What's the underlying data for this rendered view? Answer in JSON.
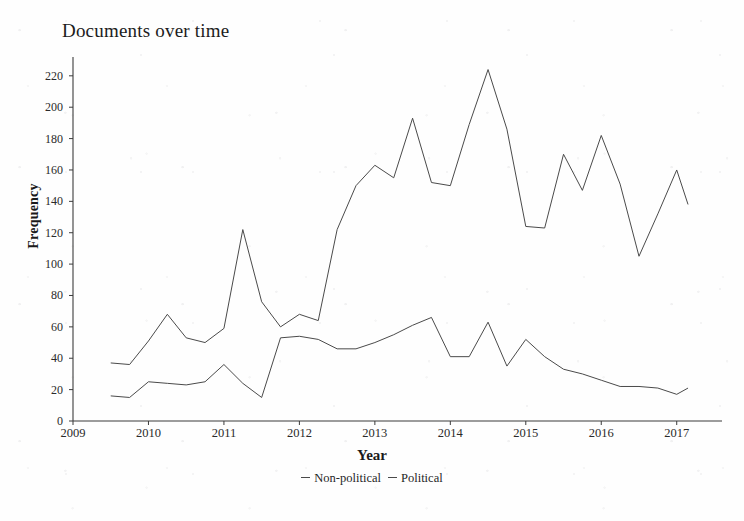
{
  "chart_data": {
    "type": "line",
    "title": "Documents over time",
    "xlabel": "Year",
    "ylabel": "Frequency",
    "xlim": [
      2009,
      2017.6
    ],
    "ylim": [
      0,
      232
    ],
    "grid": false,
    "legend_position": "bottom",
    "x_ticks": [
      "2009",
      "2010",
      "2011",
      "2012",
      "2013",
      "2014",
      "2015",
      "2016",
      "2017"
    ],
    "y_ticks": [
      "0",
      "20",
      "40",
      "60",
      "80",
      "100",
      "120",
      "140",
      "160",
      "180",
      "200",
      "220"
    ],
    "x": [
      2009.5,
      2009.75,
      2010.0,
      2010.25,
      2010.5,
      2010.75,
      2011.0,
      2011.25,
      2011.5,
      2011.75,
      2012.0,
      2012.25,
      2012.5,
      2012.75,
      2013.0,
      2013.25,
      2013.5,
      2013.75,
      2014.0,
      2014.25,
      2014.5,
      2014.75,
      2015.0,
      2015.25,
      2015.5,
      2015.75,
      2016.0,
      2016.25,
      2016.5,
      2016.75,
      2017.0,
      2017.15
    ],
    "series": [
      {
        "name": "Non-political",
        "color": "#4a4a4a",
        "values": [
          37,
          36,
          51,
          68,
          53,
          50,
          59,
          122,
          76,
          60,
          68,
          64,
          122,
          150,
          163,
          155,
          193,
          152,
          150,
          189,
          224,
          186,
          124,
          123,
          170,
          147,
          182,
          151,
          105,
          132,
          160,
          138
        ]
      },
      {
        "name": "Political",
        "color": "#4a4a4a",
        "values": [
          16,
          15,
          25,
          24,
          23,
          25,
          36,
          24,
          15,
          53,
          54,
          52,
          46,
          46,
          50,
          55,
          61,
          66,
          41,
          41,
          63,
          35,
          52,
          41,
          33,
          30,
          26,
          22,
          22,
          21,
          17,
          21
        ]
      }
    ]
  }
}
